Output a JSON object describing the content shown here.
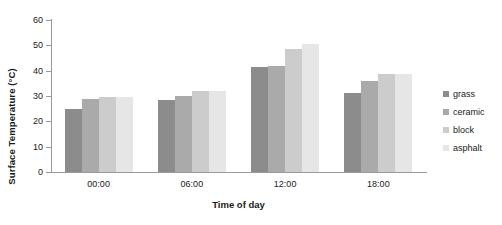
{
  "chart_data": {
    "type": "bar",
    "title": "",
    "xlabel": "Time of day",
    "ylabel": "Surface Temperature (°C)",
    "categories": [
      "00:00",
      "06:00",
      "12:00",
      "18:00"
    ],
    "series": [
      {
        "name": "grass",
        "color": "#8c8c8c",
        "values": [
          25,
          28.5,
          41.5,
          31
        ]
      },
      {
        "name": "ceramic",
        "color": "#aaaaaa",
        "values": [
          29,
          30,
          42,
          36
        ]
      },
      {
        "name": "block",
        "color": "#cccccc",
        "values": [
          29.8,
          32,
          48.5,
          38.5
        ]
      },
      {
        "name": "asphalt",
        "color": "#e6e6e6",
        "values": [
          29.8,
          31.8,
          50.5,
          38.8
        ]
      }
    ],
    "ylim": [
      0,
      60
    ],
    "yticks": [
      0,
      10,
      20,
      30,
      40,
      50,
      60
    ],
    "ytick_labels": [
      "0",
      "10",
      "20",
      "30",
      "40",
      "50",
      "60"
    ],
    "grid": false,
    "legend_position": "right",
    "axis_color": "#9a9a9a",
    "background": "#ffffff"
  }
}
